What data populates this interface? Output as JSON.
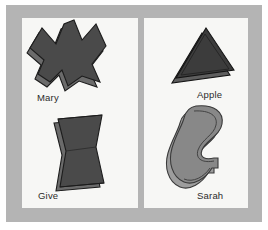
{
  "figure": {
    "background_color": "#ffffff",
    "matte_color": "#b4b4b4",
    "panel_color": "#f7f7f5"
  },
  "panels": [
    {
      "id": "left-panel",
      "name": "left-stimulus-panel",
      "shapes": [
        {
          "id": "mary",
          "label": "Mary",
          "icon_name": "m-zigzag-polygon-shape",
          "face_color": "#4a4a4a",
          "side_color": "#6b6b6b",
          "outline_color": "#1c1c1c",
          "description": "dark gray angular M-like zigzag polygon with extruded 3D edge"
        },
        {
          "id": "give",
          "label": "Give",
          "icon_name": "hourglass-bowtie-shape",
          "face_color": "#4a4a4a",
          "side_color": "#6b6b6b",
          "outline_color": "#1c1c1c",
          "description": "dark gray vertical hourglass bowtie polygon with extruded 3D edge"
        }
      ]
    },
    {
      "id": "right-panel",
      "name": "right-stimulus-panel",
      "shapes": [
        {
          "id": "apple",
          "label": "Apple",
          "icon_name": "triangle-shape",
          "face_color": "#3c3c3c",
          "side_color": "#5e5e5e",
          "outline_color": "#141414",
          "description": "dark gray triangle with extruded 3D edge"
        },
        {
          "id": "sarah",
          "label": "Sarah",
          "icon_name": "curved-blob-shape",
          "face_color": "#888888",
          "side_color": "#9d9d9d",
          "outline_color": "#3a3a3a",
          "description": "medium gray curved kidney-bean blob with small notch on right and extruded 3D edge"
        }
      ]
    }
  ]
}
